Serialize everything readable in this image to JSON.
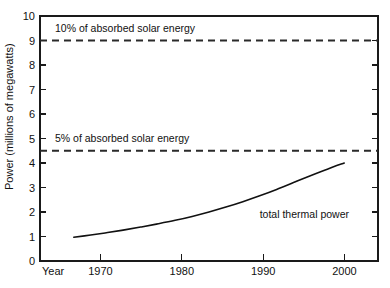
{
  "chart_data": {
    "type": "line",
    "title": "",
    "subtitle": "",
    "xlabel": "Year",
    "ylabel": "Power (millions of megawatts)",
    "xlim": [
      1964,
      2004
    ],
    "ylim": [
      0,
      10
    ],
    "grid": false,
    "legend": "none",
    "x_ticks": [
      1970,
      1980,
      1990,
      2000
    ],
    "x_tick_labels": [
      "1970",
      "1980",
      "1990",
      "2000"
    ],
    "y_ticks": [
      0,
      1,
      2,
      3,
      4,
      5,
      6,
      7,
      8,
      9,
      10
    ],
    "y_tick_labels": [
      "0",
      "1",
      "2",
      "3",
      "4",
      "5",
      "6",
      "7",
      "8",
      "9",
      "10"
    ],
    "series": [
      {
        "name": "total thermal power",
        "style": "solid",
        "x": [
          1968,
          1970,
          1972,
          1974,
          1976,
          1978,
          1980,
          1982,
          1984,
          1986,
          1988,
          1990,
          1992,
          1994,
          1996,
          1998,
          2000
        ],
        "values": [
          0.97,
          1.06,
          1.16,
          1.27,
          1.39,
          1.52,
          1.66,
          1.82,
          2.0,
          2.2,
          2.42,
          2.66,
          2.92,
          3.2,
          3.48,
          3.75,
          4.0
        ]
      }
    ],
    "reference_lines": [
      {
        "name": "ten-percent-absorbed-solar",
        "label": "10% of absorbed solar energy",
        "value": 9.0,
        "style": "dashed"
      },
      {
        "name": "five-percent-absorbed-solar",
        "label": "5% of absorbed solar energy",
        "value": 4.5,
        "style": "dashed"
      }
    ],
    "annotations": [
      {
        "name": "series-label-total-thermal-power",
        "text": "total thermal power",
        "x": 1990,
        "y": 1.75
      }
    ],
    "colors": {
      "axis": "#1a1a1a",
      "curve": "#111111",
      "reference_line": "#2a2a2a",
      "background": "#ffffff"
    }
  }
}
